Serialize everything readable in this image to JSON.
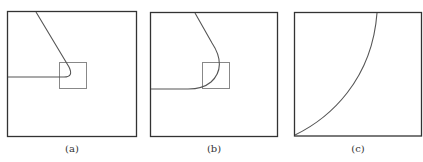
{
  "panels": [
    {
      "id": "a",
      "caption": "(a)"
    },
    {
      "id": "b",
      "caption": "(b)"
    },
    {
      "id": "c",
      "caption": "(c)"
    }
  ],
  "colors": {
    "frame": "#333333",
    "curve": "#555555",
    "inset": "#888888"
  }
}
